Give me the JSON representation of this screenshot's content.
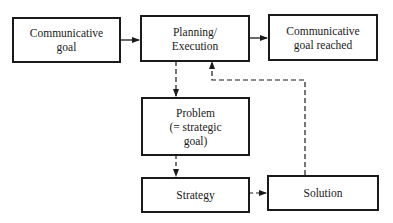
{
  "diagram": {
    "nodes": {
      "communicative_goal": {
        "label": "Communicative\ngoal"
      },
      "planning_execution": {
        "label": "Planning/\nExecution"
      },
      "goal_reached": {
        "label": "Communicative\ngoal reached"
      },
      "problem": {
        "label": "Problem\n(= strategic\ngoal)"
      },
      "strategy": {
        "label": "Strategy"
      },
      "solution": {
        "label": "Solution"
      }
    },
    "edges": [
      {
        "from": "communicative_goal",
        "to": "planning_execution",
        "style": "solid"
      },
      {
        "from": "planning_execution",
        "to": "goal_reached",
        "style": "solid"
      },
      {
        "from": "planning_execution",
        "to": "problem",
        "style": "dashed"
      },
      {
        "from": "problem",
        "to": "strategy",
        "style": "dashed"
      },
      {
        "from": "strategy",
        "to": "solution",
        "style": "dashed"
      },
      {
        "from": "solution",
        "to": "planning_execution",
        "style": "dashed"
      }
    ],
    "colors": {
      "line": "#1a1a1a",
      "background": "#ffffff"
    }
  }
}
